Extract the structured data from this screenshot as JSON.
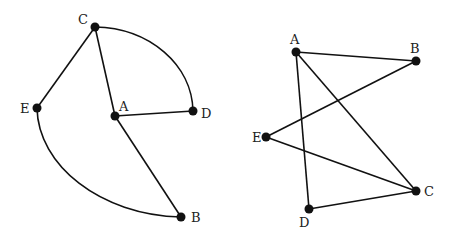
{
  "graphs": [
    {
      "id": "left",
      "nodes": [
        {
          "id": "C",
          "label": "C",
          "x": 95,
          "y": 27,
          "lx": 78,
          "ly": 24
        },
        {
          "id": "E",
          "label": "E",
          "x": 37,
          "y": 108,
          "lx": 20,
          "ly": 113
        },
        {
          "id": "A",
          "label": "A",
          "x": 115,
          "y": 116,
          "lx": 119,
          "ly": 111
        },
        {
          "id": "D",
          "label": "D",
          "x": 193,
          "y": 111,
          "lx": 201,
          "ly": 118
        },
        {
          "id": "B",
          "label": "B",
          "x": 181,
          "y": 217,
          "lx": 191,
          "ly": 222
        }
      ],
      "edges": [
        {
          "from": "C",
          "to": "E",
          "type": "line"
        },
        {
          "from": "C",
          "to": "A",
          "type": "line"
        },
        {
          "from": "A",
          "to": "D",
          "type": "line"
        },
        {
          "from": "A",
          "to": "B",
          "type": "line"
        },
        {
          "from": "C",
          "to": "D",
          "type": "arc",
          "d": "M95,27 C150,28 192,65 193,111"
        },
        {
          "from": "E",
          "to": "B",
          "type": "arc",
          "d": "M37,108 C38,165 100,215 181,217"
        }
      ]
    },
    {
      "id": "right",
      "nodes": [
        {
          "id": "A",
          "label": "A",
          "x": 296,
          "y": 52,
          "lx": 290,
          "ly": 44
        },
        {
          "id": "B",
          "label": "B",
          "x": 416,
          "y": 61,
          "lx": 410,
          "ly": 53
        },
        {
          "id": "E",
          "label": "E",
          "x": 266,
          "y": 137,
          "lx": 252,
          "ly": 142
        },
        {
          "id": "C",
          "label": "C",
          "x": 416,
          "y": 191,
          "lx": 424,
          "ly": 196
        },
        {
          "id": "D",
          "label": "D",
          "x": 309,
          "y": 209,
          "lx": 299,
          "ly": 227
        }
      ],
      "edges": [
        {
          "from": "A",
          "to": "B",
          "type": "line"
        },
        {
          "from": "A",
          "to": "D",
          "type": "line"
        },
        {
          "from": "A",
          "to": "C",
          "type": "line"
        },
        {
          "from": "B",
          "to": "E",
          "type": "line"
        },
        {
          "from": "E",
          "to": "C",
          "type": "line"
        },
        {
          "from": "D",
          "to": "C",
          "type": "line"
        }
      ]
    }
  ]
}
